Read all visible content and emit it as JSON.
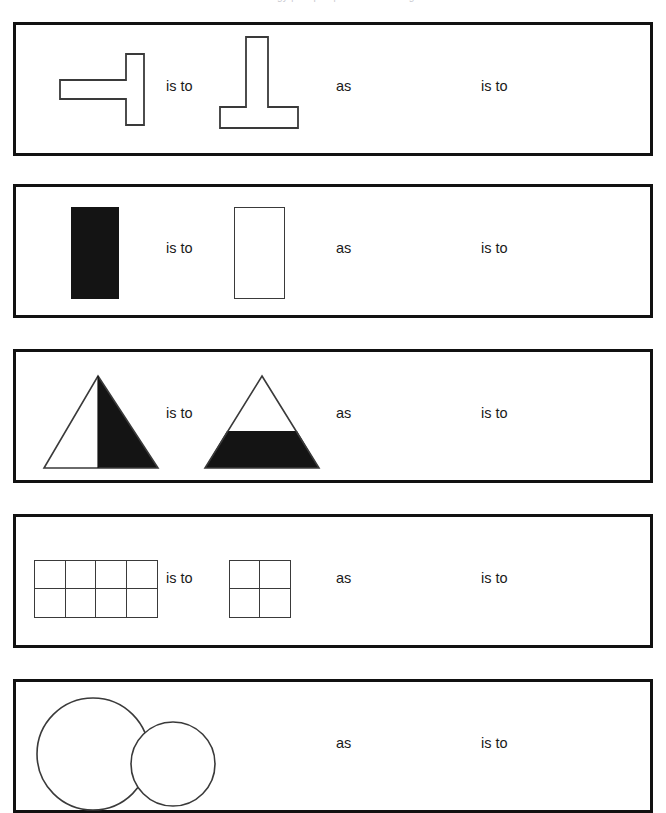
{
  "page": {
    "clipped_header_text": "analogy | shapes | visual reasoning",
    "background_color": "#ffffff",
    "ink_color": "#111111",
    "fill_color": "#141414",
    "stroke_color": "#3a3a3a",
    "width": 666,
    "height": 767
  },
  "connectors": {
    "is_to": "is to",
    "as": "as"
  },
  "rows": [
    {
      "id": "row-1",
      "first_shape": "tee-rotated-left-outline",
      "second_shape": "tee-inverted-outline",
      "is_to_1": "is to",
      "as": "as",
      "is_to_2": "is to",
      "answer": ""
    },
    {
      "id": "row-2",
      "first_shape": "rectangle-filled-black",
      "second_shape": "rectangle-outline-white",
      "is_to_1": "is to",
      "as": "as",
      "is_to_2": "is to",
      "answer": ""
    },
    {
      "id": "row-3",
      "first_shape": "triangle-right-half-filled",
      "second_shape": "triangle-bottom-portion-filled",
      "is_to_1": "is to",
      "as": "as",
      "is_to_2": "is to",
      "answer": ""
    },
    {
      "id": "row-4",
      "first_shape": "grid-4x2",
      "second_shape": "grid-2x2",
      "is_to_1": "is to",
      "as": "as",
      "is_to_2": "is to",
      "answer": ""
    },
    {
      "id": "row-5",
      "first_shape": "circle-large-outline",
      "second_shape": "circle-small-outline",
      "is_to_1": "is to",
      "as": "as",
      "is_to_2": "is to",
      "answer": ""
    }
  ]
}
